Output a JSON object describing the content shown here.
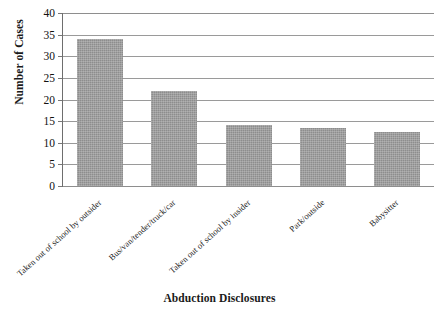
{
  "chart_data": {
    "type": "bar",
    "title": "",
    "xlabel": "Abduction Disclosures",
    "ylabel": "Number of Cases",
    "categories": [
      "Taken out of school by outsider",
      "Bus/van/tender/truck/car",
      "Taken out of school by insider",
      "Park/outside",
      "Babysitter"
    ],
    "values": [
      34,
      22,
      14,
      13.5,
      12.5
    ],
    "ylim": [
      0,
      40
    ],
    "ytick_labels": [
      "0",
      "5",
      "10",
      "15",
      "20",
      "25",
      "30",
      "35",
      "40"
    ],
    "ytick_values": [
      0,
      5,
      10,
      15,
      20,
      25,
      30,
      35,
      40
    ],
    "grid": true,
    "legend": "none",
    "bar_color": "#8d8d8d",
    "gridline_color": "#9a9a9a",
    "axis_color": "#6e6e6e",
    "background": "#ffffff"
  }
}
